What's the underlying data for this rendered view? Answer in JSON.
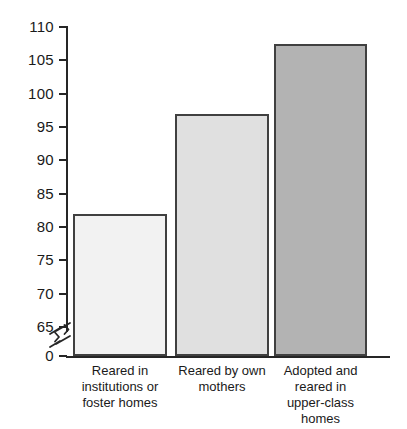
{
  "chart_data": {
    "type": "bar",
    "title": "",
    "subtitle": "",
    "xlabel": "",
    "ylabel": "",
    "categories": [
      "Reared in institutions or foster homes",
      "Reared by own mothers",
      "Adopted and reared in upper-class homes"
    ],
    "category_lines": [
      [
        "Reared in",
        "institutions or",
        "foster homes"
      ],
      [
        "Reared by own",
        "mothers"
      ],
      [
        "Adopted and",
        "reared in",
        "upper-class",
        "homes"
      ]
    ],
    "values": [
      82,
      97,
      107.5
    ],
    "ylim": [
      65,
      110
    ],
    "y_axis_origin_label": "0",
    "y_axis_break": true,
    "y_ticks": [
      65,
      70,
      75,
      80,
      85,
      90,
      95,
      100,
      105,
      110
    ],
    "y_tick_labels": [
      "65",
      "70",
      "75",
      "80",
      "85",
      "90",
      "95",
      "100",
      "105",
      "110"
    ],
    "grid": false,
    "legend": null,
    "bar_colors": [
      "#f2f2f2",
      "#e0e0e0",
      "#b3b3b3"
    ],
    "bar_edge_color": "#404040",
    "axis_color": "#262626"
  }
}
